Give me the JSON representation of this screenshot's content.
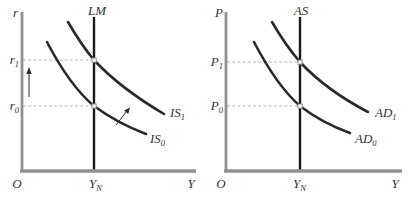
{
  "figure": {
    "colors": {
      "background": "#ffffff",
      "axis": "#909090",
      "vertical_line": "#1a1a1a",
      "curve": "#2a2a2a",
      "dashed": "#b0b0b0",
      "marker_fill": "#f8f8f8",
      "marker_stroke": "#8a8a8a",
      "arrow": "#2a2a2a",
      "text": "#333333"
    },
    "panels": [
      {
        "name": "IS-LM diagram",
        "y_axis_label": "r",
        "x_axis_label": "Y",
        "origin_label": "O",
        "x_tick_label": {
          "main": "Y",
          "sub": "N"
        },
        "vertical_curve_label": "LM",
        "upper_curve_label": {
          "main": "IS",
          "sub": "1"
        },
        "lower_curve_label": {
          "main": "IS",
          "sub": "0"
        },
        "upper_level_label": {
          "main": "r",
          "sub": "1"
        },
        "lower_level_label": {
          "main": "r",
          "sub": "0"
        }
      },
      {
        "name": "AD-AS diagram",
        "y_axis_label": "P",
        "x_axis_label": "Y",
        "origin_label": "O",
        "x_tick_label": {
          "main": "Y",
          "sub": "N"
        },
        "vertical_curve_label": "AS",
        "upper_curve_label": {
          "main": "AD",
          "sub": "1"
        },
        "lower_curve_label": {
          "main": "AD",
          "sub": "0"
        },
        "upper_level_label": {
          "main": "P",
          "sub": "1"
        },
        "lower_level_label": {
          "main": "P",
          "sub": "0"
        }
      }
    ]
  }
}
